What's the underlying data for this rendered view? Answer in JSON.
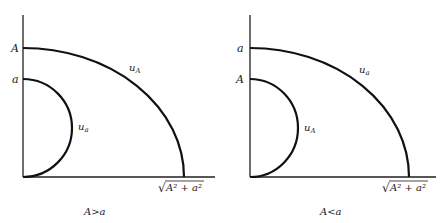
{
  "panels": [
    {
      "id": "left",
      "caption": "A>a",
      "y_labels": {
        "upper": "A",
        "lower": "a"
      },
      "outer_curve_label": {
        "base": "u",
        "sub": "A"
      },
      "inner_curve_label": {
        "base": "u",
        "sub": "a"
      },
      "x_intercept_label": {
        "radical": "√",
        "radicand": "A² + a²"
      }
    },
    {
      "id": "right",
      "caption": "A<a",
      "y_labels": {
        "upper": "a",
        "lower": "A"
      },
      "outer_curve_label": {
        "base": "u",
        "sub": "a"
      },
      "inner_curve_label": {
        "base": "u",
        "sub": "A"
      },
      "x_intercept_label": {
        "radical": "√",
        "radicand": "A² + a²"
      }
    }
  ],
  "colors": {
    "stroke": "#111111",
    "background": "#ffffff"
  }
}
